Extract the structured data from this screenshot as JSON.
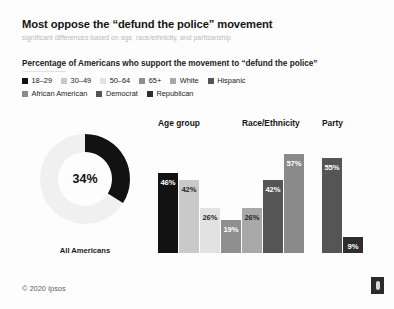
{
  "header": {
    "title": "Most oppose the “defund the police” movement",
    "subtitle": "significant differences based on age, race/ethnicity, and partisanship"
  },
  "section": {
    "label": "Percentage of Americans who support the movement to “defund the police”"
  },
  "legend": {
    "row1": [
      {
        "label": "18–29",
        "color": "#121212"
      },
      {
        "label": "30–49",
        "color": "#c9c9c9"
      },
      {
        "label": "50–64",
        "color": "#e2e2e2"
      },
      {
        "label": "65+",
        "color": "#8f8f8f"
      },
      {
        "label": "White",
        "color": "#a8a8a8"
      },
      {
        "label": "Hispanic",
        "color": "#555555"
      }
    ],
    "row2": [
      {
        "label": "African American",
        "color": "#8a8a8a"
      },
      {
        "label": "Democrat",
        "color": "#555555"
      },
      {
        "label": "Republican",
        "color": "#2e2e2e"
      }
    ]
  },
  "donut": {
    "value_label": "34%",
    "caption": "All Americans",
    "percent": 34,
    "arc_color": "#121212",
    "track_color": "#f0f0f0"
  },
  "footer": {
    "copyright": "© 2020 Ipsos",
    "logo_name": "ipsos-logo"
  },
  "chart_data": {
    "type": "bar",
    "title": "Most oppose the “defund the police” movement",
    "subtitle": "significant differences based on age, race/ethnicity, and partisanship",
    "axis_note": "Percentage of Americans who support the movement to “defund the police”",
    "xlabel": "",
    "ylabel": "Percent support",
    "ylim": [
      0,
      60
    ],
    "grid": false,
    "legend_position": "top",
    "value_suffix": "%",
    "overall": {
      "label": "All Americans",
      "value": 34,
      "display": "34%"
    },
    "groups": [
      {
        "name": "Age group",
        "categories": [
          "18–29",
          "30–49",
          "50–64",
          "65+"
        ],
        "values": [
          46,
          42,
          26,
          19
        ],
        "displays": [
          "46%",
          "42%",
          "26%",
          "19%"
        ],
        "colors": [
          "#121212",
          "#c9c9c9",
          "#e2e2e2",
          "#8f8f8f"
        ],
        "label_colors": [
          "#ffffff",
          "#2a2a2a",
          "#2a2a2a",
          "#ffffff"
        ]
      },
      {
        "name": "Race/Ethnicity",
        "categories": [
          "White",
          "Hispanic",
          "African American"
        ],
        "values": [
          26,
          42,
          57
        ],
        "displays": [
          "26%",
          "42%",
          "57%"
        ],
        "colors": [
          "#a8a8a8",
          "#555555",
          "#8a8a8a"
        ],
        "label_colors": [
          "#1f1f1f",
          "#ffffff",
          "#ffffff"
        ]
      },
      {
        "name": "Party",
        "categories": [
          "Democrat",
          "Republican"
        ],
        "values": [
          55,
          9
        ],
        "displays": [
          "55%",
          "9%"
        ],
        "colors": [
          "#555555",
          "#2e2e2e"
        ],
        "label_colors": [
          "#ffffff",
          "#ffffff"
        ]
      }
    ]
  }
}
